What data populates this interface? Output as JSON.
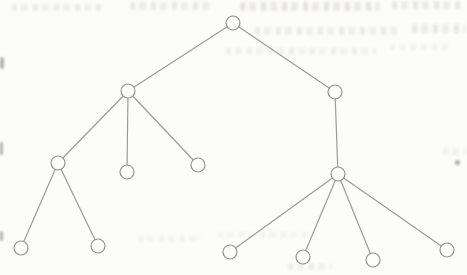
{
  "canvas": {
    "width": 467,
    "height": 275,
    "background": "#fcfcfa"
  },
  "diagram": {
    "type": "tree",
    "node_radius": 7,
    "node_fill": "#fdfdfc",
    "node_stroke": "#929292",
    "node_stroke_width": 1.2,
    "edge_color": "#9b9b9b",
    "edge_width": 1.2,
    "nodes": [
      {
        "id": "root",
        "x": 233,
        "y": 23
      },
      {
        "id": "left",
        "x": 128,
        "y": 91
      },
      {
        "id": "right",
        "x": 335,
        "y": 92
      },
      {
        "id": "left-1",
        "x": 58,
        "y": 163
      },
      {
        "id": "left-2",
        "x": 127,
        "y": 172
      },
      {
        "id": "left-3",
        "x": 198,
        "y": 165
      },
      {
        "id": "right-1",
        "x": 338,
        "y": 174
      },
      {
        "id": "left-1a",
        "x": 21,
        "y": 248
      },
      {
        "id": "left-1b",
        "x": 98,
        "y": 246
      },
      {
        "id": "right-1a",
        "x": 230,
        "y": 252
      },
      {
        "id": "right-1b",
        "x": 303,
        "y": 257
      },
      {
        "id": "right-1c",
        "x": 373,
        "y": 260
      },
      {
        "id": "right-1d",
        "x": 447,
        "y": 250
      }
    ],
    "edges": [
      [
        "root",
        "left"
      ],
      [
        "root",
        "right"
      ],
      [
        "left",
        "left-1"
      ],
      [
        "left",
        "left-2"
      ],
      [
        "left",
        "left-3"
      ],
      [
        "right",
        "right-1"
      ],
      [
        "left-1",
        "left-1a"
      ],
      [
        "left-1",
        "left-1b"
      ],
      [
        "right-1",
        "right-1a"
      ],
      [
        "right-1",
        "right-1b"
      ],
      [
        "right-1",
        "right-1c"
      ],
      [
        "right-1",
        "right-1d"
      ]
    ]
  },
  "bleedthrough": {
    "color": "#8c8578",
    "smudges": [
      {
        "x": 12,
        "y": 4,
        "w": 90,
        "h": 7,
        "opacity": 0.3
      },
      {
        "x": 130,
        "y": 2,
        "w": 84,
        "h": 8,
        "opacity": 0.34
      },
      {
        "x": 240,
        "y": 2,
        "w": 140,
        "h": 9,
        "opacity": 0.4
      },
      {
        "x": 392,
        "y": 1,
        "w": 72,
        "h": 8,
        "opacity": 0.36
      },
      {
        "x": 255,
        "y": 27,
        "w": 145,
        "h": 8,
        "opacity": 0.3
      },
      {
        "x": 412,
        "y": 24,
        "w": 54,
        "h": 9,
        "opacity": 0.34
      },
      {
        "x": 226,
        "y": 48,
        "w": 150,
        "h": 7,
        "opacity": 0.24
      },
      {
        "x": 390,
        "y": 44,
        "w": 60,
        "h": 6,
        "opacity": 0.18
      },
      {
        "x": 443,
        "y": 148,
        "w": 24,
        "h": 7,
        "opacity": 0.22
      },
      {
        "x": 138,
        "y": 236,
        "w": 64,
        "h": 6,
        "opacity": 0.18
      },
      {
        "x": 218,
        "y": 232,
        "w": 96,
        "h": 6,
        "opacity": 0.16
      },
      {
        "x": 288,
        "y": 263,
        "w": 44,
        "h": 7,
        "opacity": 0.26
      }
    ],
    "specks": [
      {
        "x": 0,
        "y": 57,
        "w": 4,
        "h": 12
      },
      {
        "x": 0,
        "y": 142,
        "w": 3,
        "h": 13
      },
      {
        "x": 0,
        "y": 231,
        "w": 3,
        "h": 10
      },
      {
        "x": 455,
        "y": 160,
        "w": 5,
        "h": 5
      }
    ]
  }
}
